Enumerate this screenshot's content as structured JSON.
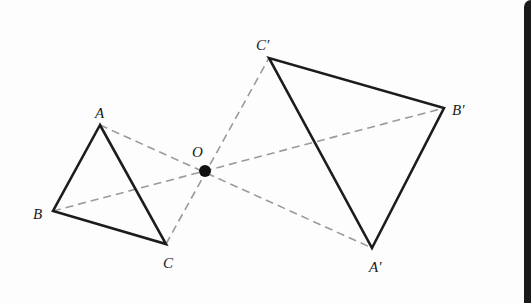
{
  "diagram": {
    "title": "",
    "colors": {
      "solid_stroke": "#1c1c1c",
      "dashed_stroke": "#9a9a9a",
      "background": "#fdfdfd",
      "edge_strip": "#1a1a1a"
    },
    "center": {
      "name": "O",
      "label": "O",
      "x": 205,
      "y": 171,
      "label_x": 192,
      "label_y": 157
    },
    "original_triangle": {
      "vertices": [
        {
          "name": "A",
          "label": "A",
          "x": 100,
          "y": 125,
          "label_x": 95,
          "label_y": 118
        },
        {
          "name": "B",
          "label": "B",
          "x": 53,
          "y": 211,
          "label_x": 33,
          "label_y": 219
        },
        {
          "name": "C",
          "label": "C",
          "x": 166,
          "y": 244,
          "label_x": 163,
          "label_y": 268
        }
      ]
    },
    "image_triangle": {
      "vertices": [
        {
          "name": "A'",
          "label": "A′",
          "x": 372,
          "y": 248,
          "label_x": 369,
          "label_y": 272
        },
        {
          "name": "B'",
          "label": "B′",
          "x": 444,
          "y": 108,
          "label_x": 452,
          "label_y": 115
        },
        {
          "name": "C'",
          "label": "C′",
          "x": 269,
          "y": 58,
          "label_x": 256,
          "label_y": 50
        }
      ]
    },
    "dashed_lines": [
      {
        "from": "A",
        "to": "A'",
        "x1": 100,
        "y1": 125,
        "x2": 372,
        "y2": 248
      },
      {
        "from": "B",
        "to": "B'",
        "x1": 53,
        "y1": 211,
        "x2": 444,
        "y2": 108
      },
      {
        "from": "C",
        "to": "C'",
        "x1": 166,
        "y1": 244,
        "x2": 269,
        "y2": 58
      }
    ]
  }
}
